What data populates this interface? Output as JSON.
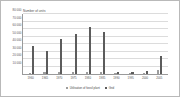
{
  "chart_data": {
    "type": "bar",
    "title": "",
    "ylabel": "Number of units",
    "xlabel": "",
    "ylim": [
      0,
      80000
    ],
    "grid": true,
    "legend_position": "bottom",
    "ytick_labels": [
      "10 000",
      "20 000",
      "30 000",
      "40 000",
      "50 000",
      "60 000",
      "70 000",
      "80 000"
    ],
    "ytick_values": [
      10000,
      20000,
      30000,
      40000,
      50000,
      60000,
      70000,
      80000
    ],
    "categories": [
      "1960",
      "1965",
      "1970",
      "1975",
      "1980",
      "1985",
      "1990",
      "1995",
      "2000",
      "2005"
    ],
    "series": [
      {
        "name": "Utilisation of fossil plant",
        "color": "#9d9d9d",
        "values": [
          1800,
          2200,
          2600,
          2400,
          2800,
          2600,
          1200,
          900,
          1400,
          5200
        ]
      },
      {
        "name": "Grid",
        "color": "#5c5c5c",
        "values": [
          37000,
          31000,
          47000,
          54000,
          63000,
          56000,
          2200,
          2600,
          3400,
          24000
        ]
      }
    ],
    "legend": [
      {
        "label": "Utilisation of fossil plant",
        "color": "#9d9d9d"
      },
      {
        "label": "Grid",
        "color": "#5c5c5c"
      }
    ]
  }
}
